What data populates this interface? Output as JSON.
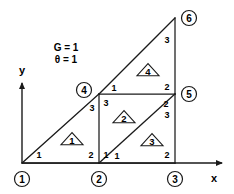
{
  "figure": {
    "background": "#ffffff",
    "stroke_color": "#1a1a1a"
  },
  "parameters": [
    {
      "name": "conductance",
      "label": "G = 1",
      "x": 66,
      "y": 47
    },
    {
      "name": "theta",
      "label": "θ = 1",
      "x": 66,
      "y": 59
    }
  ],
  "axes": {
    "x": {
      "label": "x",
      "label_x": 214,
      "label_y": 178,
      "start_x": 22,
      "start_y": 163,
      "end_x": 222,
      "end_y": 163
    },
    "y": {
      "label": "y",
      "label_x": 22,
      "label_y": 70,
      "start_x": 22,
      "start_y": 163,
      "end_x": 22,
      "end_y": 83
    }
  },
  "nodes": [
    {
      "id": "1",
      "label": "1",
      "vx": 22,
      "vy": 163,
      "cx": 22,
      "cy": 179
    },
    {
      "id": "2",
      "label": "2",
      "vx": 99,
      "vy": 163,
      "cx": 99,
      "cy": 179
    },
    {
      "id": "3",
      "label": "3",
      "vx": 175,
      "vy": 163,
      "cx": 175,
      "cy": 179
    },
    {
      "id": "4",
      "label": "4",
      "vx": 99,
      "vy": 94,
      "cx": 84,
      "cy": 90
    },
    {
      "id": "5",
      "label": "5",
      "vx": 175,
      "vy": 94,
      "cx": 189,
      "cy": 94
    },
    {
      "id": "6",
      "label": "6",
      "vx": 175,
      "vy": 18,
      "cx": 189,
      "cy": 18
    }
  ],
  "node_circle_radius": 7.5,
  "mesh_edges": [
    {
      "name": "edge-1-2",
      "x1": 22,
      "y1": 163,
      "x2": 99,
      "y2": 163
    },
    {
      "name": "edge-2-3",
      "x1": 99,
      "y1": 163,
      "x2": 175,
      "y2": 163
    },
    {
      "name": "edge-1-4",
      "x1": 22,
      "y1": 163,
      "x2": 99,
      "y2": 94
    },
    {
      "name": "edge-4-6",
      "x1": 99,
      "y1": 94,
      "x2": 175,
      "y2": 18
    },
    {
      "name": "edge-2-4",
      "x1": 99,
      "y1": 163,
      "x2": 99,
      "y2": 94
    },
    {
      "name": "edge-4-5",
      "x1": 99,
      "y1": 94,
      "x2": 175,
      "y2": 94
    },
    {
      "name": "edge-2-5",
      "x1": 99,
      "y1": 163,
      "x2": 175,
      "y2": 94
    },
    {
      "name": "edge-3-5",
      "x1": 175,
      "y1": 163,
      "x2": 175,
      "y2": 94
    },
    {
      "name": "edge-5-6",
      "x1": 175,
      "y1": 94,
      "x2": 175,
      "y2": 18
    }
  ],
  "elements": [
    {
      "id": "1",
      "label": "1",
      "cx": 72,
      "cy": 139,
      "size": 11
    },
    {
      "id": "2",
      "label": "2",
      "cx": 124,
      "cy": 117,
      "size": 11
    },
    {
      "id": "3",
      "label": "3",
      "cx": 152,
      "cy": 140,
      "size": 11
    },
    {
      "id": "4",
      "label": "4",
      "cx": 148,
      "cy": 70,
      "size": 11
    }
  ],
  "local_node_numbers": [
    {
      "name": "elem1-local-1",
      "label": "1",
      "x": 39,
      "y": 155
    },
    {
      "name": "elem1-local-2",
      "label": "2",
      "x": 91,
      "y": 155
    },
    {
      "name": "elem1-local-3",
      "label": "3",
      "x": 92,
      "y": 108
    },
    {
      "name": "elem2-local-1",
      "label": "1",
      "x": 106,
      "y": 155
    },
    {
      "name": "elem2-local-2",
      "label": "2",
      "x": 166,
      "y": 104
    },
    {
      "name": "elem2-local-3",
      "label": "3",
      "x": 106,
      "y": 103
    },
    {
      "name": "elem3-local-1",
      "label": "1",
      "x": 117,
      "y": 156
    },
    {
      "name": "elem3-local-2",
      "label": "2",
      "x": 167,
      "y": 155
    },
    {
      "name": "elem3-local-3",
      "label": "3",
      "x": 167,
      "y": 115
    },
    {
      "name": "elem4-local-1",
      "label": "1",
      "x": 114,
      "y": 88
    },
    {
      "name": "elem4-local-2",
      "label": "2",
      "x": 167,
      "y": 87
    },
    {
      "name": "elem4-local-3",
      "label": "3",
      "x": 167,
      "y": 40
    }
  ]
}
